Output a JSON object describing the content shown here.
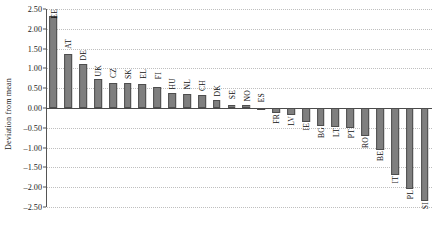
{
  "chart_data": {
    "type": "bar",
    "title": "",
    "xlabel": "",
    "ylabel": "Deviation from mean",
    "ylim": [
      -2.5,
      2.5
    ],
    "ytick_step": 0.5,
    "grid": true,
    "legend": null,
    "orientation": "vertical",
    "bar_color": "#7f7f7f",
    "bar_edge_color": "#4d4d4d",
    "label_rotation": 90,
    "ticks": [
      "2.50",
      "2.00",
      "1.50",
      "1.00",
      "0.50",
      "0.00",
      "-0.50",
      "-1.00",
      "-1.50",
      "-2.00",
      "-2.50"
    ],
    "tick_values": [
      2.5,
      2.0,
      1.5,
      1.0,
      0.5,
      0.0,
      -0.5,
      -1.0,
      -1.5,
      -2.0,
      -2.5
    ],
    "categories": [
      "EE",
      "AT",
      "DE",
      "UK",
      "CZ",
      "SK",
      "EL",
      "FI",
      "HU",
      "NL",
      "CH",
      "DK",
      "SE",
      "NO",
      "ES",
      "FR",
      "LV",
      "IE",
      "BG",
      "LT",
      "PT",
      "RO",
      "BE",
      "IT",
      "PL",
      "SI"
    ],
    "values": [
      2.33,
      1.37,
      1.1,
      0.72,
      0.63,
      0.62,
      0.6,
      0.54,
      0.38,
      0.36,
      0.33,
      0.21,
      0.07,
      0.07,
      0.01,
      -0.13,
      -0.17,
      -0.35,
      -0.46,
      -0.47,
      -0.5,
      -0.7,
      -1.05,
      -1.7,
      -2.05,
      -2.35
    ]
  }
}
